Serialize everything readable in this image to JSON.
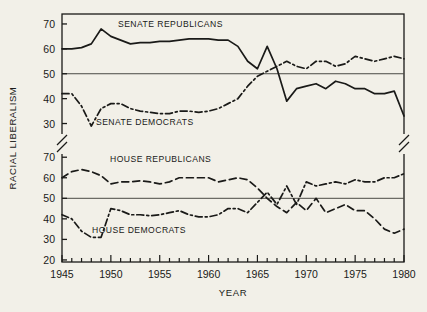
{
  "chart_data": {
    "type": "line",
    "title": "",
    "xlabel": "YEAR",
    "ylabel": "RACIAL LIBERALISM",
    "xlim": [
      1945,
      1980
    ],
    "xticks": [
      1945,
      1950,
      1955,
      1960,
      1965,
      1970,
      1975,
      1980
    ],
    "xtick_labels": [
      "1945",
      "1950",
      "1955",
      "1960",
      "1965",
      "1970",
      "1975",
      "1980"
    ],
    "minor_xticks_every": 1,
    "grid": false,
    "legend_position": "inline-annotations",
    "axis_break": true,
    "panels": [
      {
        "name": "senate",
        "ylim": [
          27,
          74
        ],
        "yticks": [
          30,
          40,
          50,
          60,
          70
        ],
        "ytick_labels": [
          "30",
          "40",
          "50",
          "60",
          "70"
        ],
        "reference_line": 50,
        "series": [
          {
            "name": "SENATE REPUBLICANS",
            "style": "solid",
            "color": "#1a1a18",
            "x": [
              1945,
              1946,
              1947,
              1948,
              1949,
              1950,
              1951,
              1952,
              1953,
              1954,
              1955,
              1956,
              1957,
              1958,
              1959,
              1960,
              1961,
              1962,
              1963,
              1964,
              1965,
              1966,
              1967,
              1968,
              1969,
              1970,
              1971,
              1972,
              1973,
              1974,
              1975,
              1976,
              1977,
              1978,
              1979,
              1980
            ],
            "values": [
              60,
              60,
              60.5,
              62,
              68,
              65,
              63.5,
              62,
              62.5,
              62.5,
              63,
              63,
              63.5,
              64,
              64,
              64,
              63.5,
              63.5,
              61,
              55,
              52,
              61,
              52,
              39,
              44,
              45,
              46,
              44,
              47,
              46,
              44,
              44,
              42,
              42,
              43,
              33
            ]
          },
          {
            "name": "SENATE DEMOCRATS",
            "style": "dash-dot",
            "color": "#1a1a18",
            "x": [
              1945,
              1946,
              1947,
              1948,
              1949,
              1950,
              1951,
              1952,
              1953,
              1954,
              1955,
              1956,
              1957,
              1958,
              1959,
              1960,
              1961,
              1962,
              1963,
              1964,
              1965,
              1966,
              1967,
              1968,
              1969,
              1970,
              1971,
              1972,
              1973,
              1974,
              1975,
              1976,
              1977,
              1978,
              1979,
              1980
            ],
            "values": [
              42,
              42,
              37,
              29,
              36,
              38,
              38,
              36,
              35,
              34.5,
              34,
              34,
              35,
              35,
              34.5,
              35,
              36,
              38,
              40,
              45,
              49,
              51,
              53,
              55,
              53,
              52,
              55,
              55,
              53,
              54,
              57,
              56,
              55,
              56,
              57,
              56
            ]
          }
        ]
      },
      {
        "name": "house",
        "ylim": [
          19,
          74
        ],
        "yticks": [
          20,
          30,
          40,
          50,
          60,
          70
        ],
        "ytick_labels": [
          "20",
          "30",
          "40",
          "50",
          "60",
          "70"
        ],
        "reference_line": 50,
        "series": [
          {
            "name": "HOUSE REPUBLICANS",
            "style": "dashed",
            "color": "#1a1a18",
            "x": [
              1945,
              1946,
              1947,
              1948,
              1949,
              1950,
              1951,
              1952,
              1953,
              1954,
              1955,
              1956,
              1957,
              1958,
              1959,
              1960,
              1961,
              1962,
              1963,
              1964,
              1965,
              1966,
              1967,
              1968,
              1969,
              1970,
              1971,
              1972,
              1973,
              1974,
              1975,
              1976,
              1977,
              1978,
              1979,
              1980
            ],
            "values": [
              60,
              63,
              64,
              63,
              61,
              57,
              58,
              58,
              58.5,
              58,
              57,
              58,
              60,
              60,
              60,
              60,
              58,
              59,
              60,
              59,
              55,
              50,
              46,
              43,
              48,
              44,
              50,
              43,
              45,
              47,
              44,
              44,
              40,
              35,
              33,
              35
            ]
          },
          {
            "name": "HOUSE DEMOCRATS",
            "style": "dash-dot",
            "color": "#1a1a18",
            "x": [
              1945,
              1946,
              1947,
              1948,
              1949,
              1950,
              1951,
              1952,
              1953,
              1954,
              1955,
              1956,
              1957,
              1958,
              1959,
              1960,
              1961,
              1962,
              1963,
              1964,
              1965,
              1966,
              1967,
              1968,
              1969,
              1970,
              1971,
              1972,
              1973,
              1974,
              1975,
              1976,
              1977,
              1978,
              1979,
              1980
            ],
            "values": [
              42,
              40,
              34,
              31,
              31,
              45,
              44,
              42,
              42,
              41.5,
              42,
              43,
              44,
              42,
              41,
              41,
              42,
              45,
              45,
              43,
              48,
              53,
              47,
              56,
              47,
              58,
              56,
              57,
              58,
              57,
              59,
              58,
              58,
              60,
              60,
              62
            ]
          }
        ]
      }
    ]
  },
  "colors": {
    "background": "#f2f0e8",
    "ink": "#1a1a18",
    "reference_line": "#4a4a44"
  }
}
